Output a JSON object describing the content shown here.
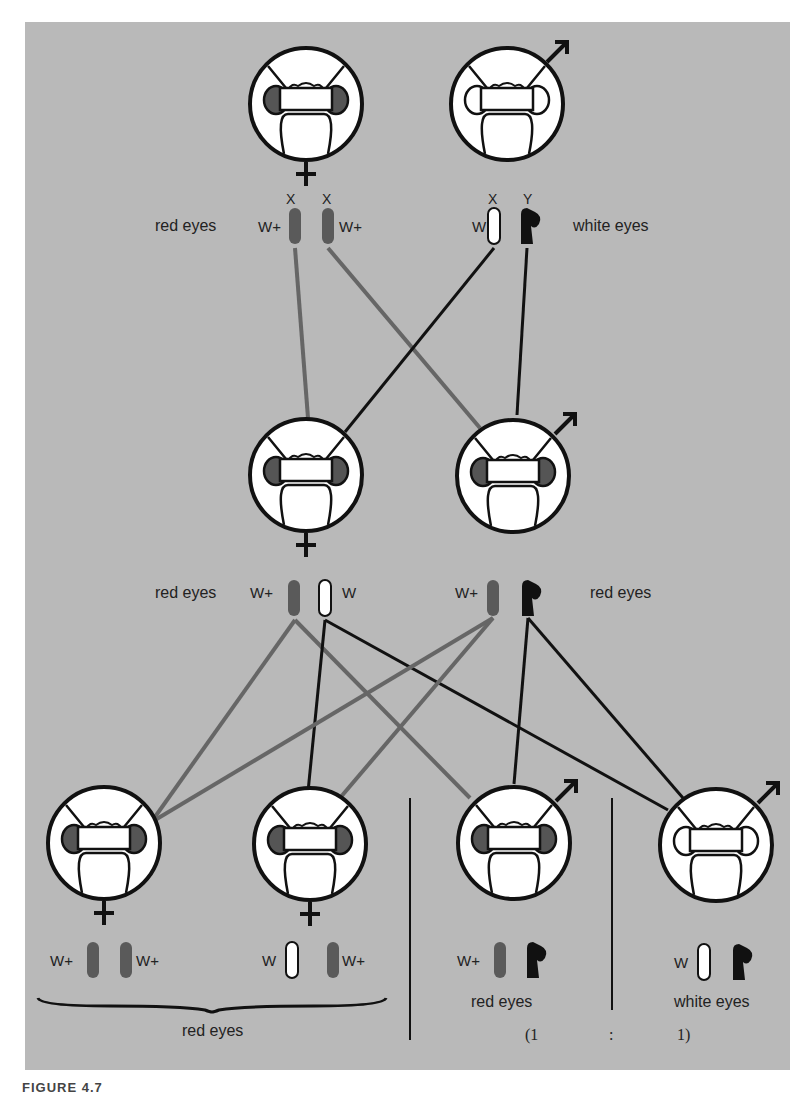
{
  "figure": {
    "caption": "FIGURE 4.7",
    "colors": {
      "background_panel": "#b9b9b9",
      "red_allele": "#5a5a5a",
      "white_allele": "#ffffff",
      "y_chromosome": "#111111",
      "red_eye": "#555555",
      "line_red": "#666666",
      "line_black": "#111111"
    }
  },
  "generations": {
    "parents": {
      "female": {
        "sex": "female",
        "eye_color": "red",
        "label": "red eyes",
        "chromosomes": [
          {
            "type": "X",
            "allele": "W+"
          },
          {
            "type": "X",
            "allele": "W+"
          }
        ]
      },
      "male": {
        "sex": "male",
        "eye_color": "white",
        "label": "white eyes",
        "chromosomes": [
          {
            "type": "X",
            "allele": "W"
          },
          {
            "type": "Y",
            "allele": ""
          }
        ]
      },
      "chrom_labels": [
        "X",
        "X",
        "X",
        "Y"
      ]
    },
    "f1": {
      "female": {
        "sex": "female",
        "eye_color": "red",
        "label": "red eyes",
        "alleles": [
          "W+",
          "W"
        ]
      },
      "male": {
        "sex": "male",
        "eye_color": "red",
        "label": "red eyes",
        "alleles": [
          "W+"
        ]
      }
    },
    "f2": {
      "offspring": [
        {
          "sex": "female",
          "eye_color": "red",
          "alleles": [
            "W+",
            "W+"
          ]
        },
        {
          "sex": "female",
          "eye_color": "red",
          "alleles": [
            "W",
            "W+"
          ]
        },
        {
          "sex": "male",
          "eye_color": "red",
          "alleles": [
            "W+"
          ],
          "label": "red eyes"
        },
        {
          "sex": "male",
          "eye_color": "white",
          "alleles": [
            "W"
          ],
          "label": "white eyes"
        }
      ],
      "female_group_label": "red eyes",
      "ratio": {
        "open": "(1",
        "sep": ":",
        "close": "1)"
      }
    }
  }
}
